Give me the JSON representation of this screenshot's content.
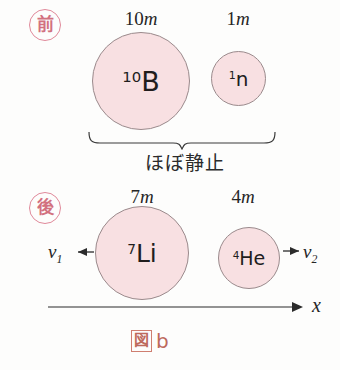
{
  "figure": {
    "caption_boxed": "図",
    "caption_letter": "b",
    "background_color": "#fdfdfc",
    "particle_fill_color": "#f8e0e2",
    "particle_stroke_color": "#9a8a8c",
    "stamp_color": "#d2717f",
    "caption_color": "#bd6a5c",
    "line_color": "#333333"
  },
  "sections": {
    "before": {
      "stamp_label": "前",
      "caption": "ほぼ静止",
      "particles": [
        {
          "mass_number": "10",
          "mass_unit": "m",
          "isotope_superscript": "10",
          "symbol": "B",
          "name": "boron-10"
        },
        {
          "mass_number": "1",
          "mass_unit": "m",
          "isotope_superscript": "1",
          "symbol": "n",
          "name": "neutron"
        }
      ]
    },
    "after": {
      "stamp_label": "後",
      "particles": [
        {
          "mass_number": "7",
          "mass_unit": "m",
          "isotope_superscript": "7",
          "symbol": "Li",
          "name": "lithium-7"
        },
        {
          "mass_number": "4",
          "mass_unit": "m",
          "isotope_superscript": "4",
          "symbol": "He",
          "name": "helium-4"
        }
      ],
      "velocity_left": {
        "symbol": "v",
        "subscript": "1",
        "direction": "left"
      },
      "velocity_right": {
        "symbol": "v",
        "subscript": "2",
        "direction": "right"
      }
    }
  },
  "axis": {
    "label": "x",
    "direction": "right"
  }
}
